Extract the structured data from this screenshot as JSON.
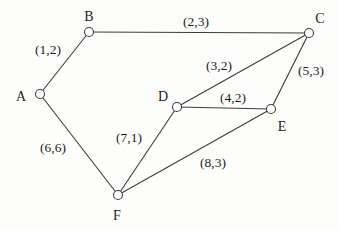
{
  "diagram": {
    "type": "undirected-graph",
    "background_color": "#fdfdfc",
    "line_color": "#3d3d3d",
    "text_color": "#1c1c1c",
    "node_fill": "#ffffff",
    "node_radius": 4.5,
    "nodes": [
      {
        "id": "A",
        "label": "A",
        "x": 40,
        "y": 94,
        "label_x": 21,
        "label_y": 96
      },
      {
        "id": "B",
        "label": "B",
        "x": 89,
        "y": 32,
        "label_x": 89,
        "label_y": 16
      },
      {
        "id": "C",
        "label": "C",
        "x": 309,
        "y": 33,
        "label_x": 320,
        "label_y": 18
      },
      {
        "id": "D",
        "label": "D",
        "x": 177,
        "y": 107,
        "label_x": 163,
        "label_y": 96
      },
      {
        "id": "E",
        "label": "E",
        "x": 271,
        "y": 109,
        "label_x": 282,
        "label_y": 126
      },
      {
        "id": "F",
        "label": "F",
        "x": 118,
        "y": 195,
        "label_x": 117,
        "label_y": 215
      }
    ],
    "edges": [
      {
        "from": "A",
        "to": "B",
        "label": "(1,2)",
        "label_x": 48,
        "label_y": 49
      },
      {
        "from": "B",
        "to": "C",
        "label": "(2,3)",
        "label_x": 196,
        "label_y": 21
      },
      {
        "from": "C",
        "to": "D",
        "label": "(3,2)",
        "label_x": 219,
        "label_y": 65
      },
      {
        "from": "C",
        "to": "E",
        "label": "(5,3)",
        "label_x": 311,
        "label_y": 70
      },
      {
        "from": "D",
        "to": "E",
        "label": "(4,2)",
        "label_x": 233,
        "label_y": 97
      },
      {
        "from": "A",
        "to": "F",
        "label": "(6,6)",
        "label_x": 53,
        "label_y": 147
      },
      {
        "from": "D",
        "to": "F",
        "label": "(7,1)",
        "label_x": 129,
        "label_y": 137
      },
      {
        "from": "E",
        "to": "F",
        "label": "(8,3)",
        "label_x": 213,
        "label_y": 162
      }
    ]
  }
}
